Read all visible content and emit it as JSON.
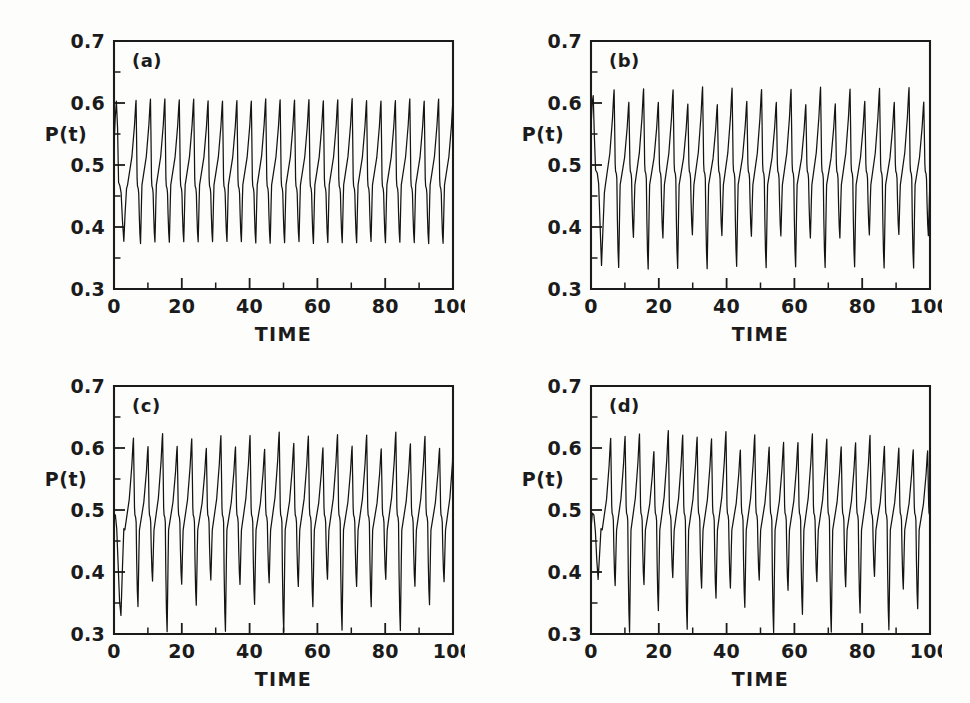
{
  "figure": {
    "background_color": "#fdfdfc",
    "ink_color": "#1b1b1b",
    "panel_count": 4
  },
  "chart_data": [
    {
      "type": "line",
      "panel_label": "(a)",
      "title": "",
      "xlabel": "TIME",
      "ylabel": "P(t)",
      "xlim": [
        0,
        100
      ],
      "ylim": [
        0.3,
        0.7
      ],
      "xticks": [
        0,
        20,
        40,
        60,
        80,
        100
      ],
      "xtick_labels": [
        "0",
        "20",
        "40",
        "60",
        "80",
        "100"
      ],
      "xticks_minor": [
        10,
        30,
        50,
        70,
        90
      ],
      "yticks": [
        0.3,
        0.4,
        0.5,
        0.6,
        0.7
      ],
      "ytick_labels": [
        "0.3",
        "0.4",
        "0.5",
        "0.6",
        "0.7"
      ],
      "yticks_minor": [
        0.35,
        0.45,
        0.55,
        0.65
      ],
      "grid": false,
      "legend": "none",
      "regime": "period-1 limit cycle",
      "period": 4.25,
      "peak_values": [
        0.605
      ],
      "trough_values": [
        0.375
      ],
      "shoulder_value": 0.465,
      "cycles": 23,
      "series": [
        {
          "name": "P(t)",
          "color": "#141414",
          "pattern": "single repeating spike: sharp rise to 0.605, fast fall with a shoulder near 0.465, dip to 0.375, slow recovery"
        }
      ]
    },
    {
      "type": "line",
      "panel_label": "(b)",
      "title": "",
      "xlabel": "TIME",
      "ylabel": "P(t)",
      "xlim": [
        0,
        100
      ],
      "ylim": [
        0.3,
        0.7
      ],
      "xticks": [
        0,
        20,
        40,
        60,
        80,
        100
      ],
      "xtick_labels": [
        "0",
        "20",
        "40",
        "60",
        "80",
        "100"
      ],
      "xticks_minor": [
        10,
        30,
        50,
        70,
        90
      ],
      "yticks": [
        0.3,
        0.4,
        0.5,
        0.6,
        0.7
      ],
      "ytick_labels": [
        "0.3",
        "0.4",
        "0.5",
        "0.6",
        "0.7"
      ],
      "yticks_minor": [
        0.35,
        0.45,
        0.55,
        0.65
      ],
      "grid": false,
      "legend": "none",
      "regime": "period-2 (period doubled)",
      "period": 8.7,
      "peak_values": [
        0.623,
        0.6
      ],
      "trough_values": [
        0.335,
        0.385
      ],
      "shoulder_value": 0.49,
      "cycles": 23,
      "series": [
        {
          "name": "P(t)",
          "color": "#141414",
          "pattern": "alternating tall peak 0.623 with deep trough 0.335, then shorter peak 0.600 with shallower trough 0.385"
        }
      ]
    },
    {
      "type": "line",
      "panel_label": "(c)",
      "title": "",
      "xlabel": "TIME",
      "ylabel": "P(t)",
      "xlim": [
        0,
        100
      ],
      "ylim": [
        0.3,
        0.7
      ],
      "xticks": [
        0,
        20,
        40,
        60,
        80,
        100
      ],
      "xtick_labels": [
        "0",
        "20",
        "40",
        "60",
        "80",
        "100"
      ],
      "xticks_minor": [
        10,
        30,
        50,
        70,
        90
      ],
      "yticks": [
        0.3,
        0.4,
        0.5,
        0.6,
        0.7
      ],
      "ytick_labels": [
        "0.3",
        "0.4",
        "0.5",
        "0.6",
        "0.7"
      ],
      "yticks_minor": [
        0.35,
        0.45,
        0.55,
        0.65
      ],
      "grid": false,
      "legend": "none",
      "regime": "period-4",
      "period": 17.2,
      "peak_values": [
        0.623,
        0.605,
        0.618,
        0.6
      ],
      "trough_values": [
        0.305,
        0.378,
        0.345,
        0.385
      ],
      "shoulder_value": 0.492,
      "deep_spike_times": [
        10,
        27,
        44,
        61,
        79,
        96
      ],
      "cycles": 23,
      "series": [
        {
          "name": "P(t)",
          "color": "#141414",
          "pattern": "four-cycle repeat; every fourth trough plunges to the 0.3 axis producing tall narrow spikes"
        }
      ]
    },
    {
      "type": "line",
      "panel_label": "(d)",
      "title": "",
      "xlabel": "TIME",
      "ylabel": "P(t)",
      "xlim": [
        0,
        100
      ],
      "ylim": [
        0.3,
        0.7
      ],
      "xticks": [
        0,
        20,
        40,
        60,
        80,
        100
      ],
      "xtick_labels": [
        "0",
        "20",
        "40",
        "60",
        "80",
        "100"
      ],
      "xticks_minor": [
        10,
        30,
        50,
        70,
        90
      ],
      "yticks": [
        0.3,
        0.4,
        0.5,
        0.6,
        0.7
      ],
      "ytick_labels": [
        "0.3",
        "0.4",
        "0.5",
        "0.6",
        "0.7"
      ],
      "yticks_minor": [
        0.35,
        0.45,
        0.55,
        0.65
      ],
      "grid": false,
      "legend": "none",
      "regime": "chaotic / aperiodic",
      "period": null,
      "peak_range": [
        0.592,
        0.628
      ],
      "trough_range": [
        0.3,
        0.395
      ],
      "shoulder_value": 0.495,
      "deep_spike_times": [
        8,
        26,
        52,
        69,
        87
      ],
      "cycles": 24,
      "series": [
        {
          "name": "P(t)",
          "color": "#141414",
          "pattern": "irregular peak heights 0.592-0.628 and irregular trough depths 0.300-0.395 with no repeating cycle"
        }
      ]
    }
  ]
}
